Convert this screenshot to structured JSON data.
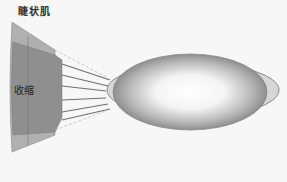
{
  "labels": {
    "title": "睫状肌",
    "contract": "收缩"
  },
  "colors": {
    "background": "#f7f7f7",
    "muscle_outer": "#a8a8a8",
    "muscle_inner": "#8e8e8e",
    "lens_edge": "#8a8a8a",
    "lens_center": "#ffffff",
    "fiber": "#777777"
  }
}
